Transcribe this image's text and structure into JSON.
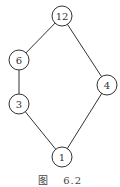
{
  "diagram": {
    "type": "hasse-diagram",
    "nodes": [
      {
        "id": "12",
        "label": "12",
        "x": 62,
        "y": 16
      },
      {
        "id": "6",
        "label": "6",
        "x": 19,
        "y": 60
      },
      {
        "id": "4",
        "label": "4",
        "x": 107,
        "y": 85
      },
      {
        "id": "3",
        "label": "3",
        "x": 19,
        "y": 104
      },
      {
        "id": "1",
        "label": "1",
        "x": 62,
        "y": 157
      }
    ],
    "edges": [
      [
        "12",
        "6"
      ],
      [
        "12",
        "4"
      ],
      [
        "6",
        "3"
      ],
      [
        "3",
        "1"
      ],
      [
        "4",
        "1"
      ]
    ]
  },
  "caption": {
    "prefix": "图",
    "number": "6.2"
  }
}
